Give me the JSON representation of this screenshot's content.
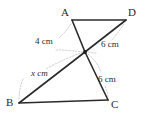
{
  "figure": {
    "kind": "geometry-diagram",
    "colors": {
      "edge": "#2b2b2b",
      "leader": "#b9b9b9",
      "label": "#2b2b2b",
      "node": "#1b1b1b",
      "background": "#ffffff"
    },
    "vertices": [
      {
        "id": "A",
        "label": "A",
        "x": 72,
        "y": 20,
        "label_x": 61,
        "label_y": 16
      },
      {
        "id": "D",
        "label": "D",
        "x": 126,
        "y": 20,
        "label_x": 128,
        "label_y": 16
      },
      {
        "id": "B",
        "label": "B",
        "x": 19,
        "y": 103,
        "label_x": 6,
        "label_y": 106
      },
      {
        "id": "C",
        "label": "C",
        "x": 108,
        "y": 100,
        "label_x": 111,
        "label_y": 108
      },
      {
        "id": "E",
        "label": "",
        "x": 85,
        "y": 52,
        "label_x": 85,
        "label_y": 52
      }
    ],
    "edges": [
      {
        "id": "AD",
        "from": "A",
        "to": "D"
      },
      {
        "id": "AE",
        "from": "A",
        "to": "E"
      },
      {
        "id": "DE",
        "from": "D",
        "to": "E"
      },
      {
        "id": "EC",
        "from": "E",
        "to": "C"
      },
      {
        "id": "BE",
        "from": "B",
        "to": "E"
      },
      {
        "id": "BC",
        "from": "B",
        "to": "C"
      }
    ],
    "measurements": [
      {
        "id": "AE",
        "text": "4 cm",
        "value": "4",
        "unit": "cm",
        "variable": false,
        "x": 35,
        "y": 44
      },
      {
        "id": "DE",
        "text": "6 cm",
        "value": "6",
        "unit": "cm",
        "variable": false,
        "x": 101,
        "y": 47
      },
      {
        "id": "EC",
        "text": "6 cm",
        "value": "6",
        "unit": "cm",
        "variable": false,
        "x": 98,
        "y": 82
      },
      {
        "id": "BE",
        "text": "x cm",
        "value": "x",
        "unit": "cm",
        "variable": true,
        "x": 31,
        "y": 76
      }
    ]
  }
}
